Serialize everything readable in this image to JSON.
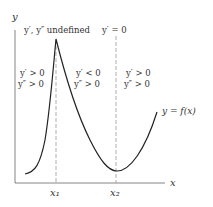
{
  "diagram": {
    "axes": {
      "y_label": "y",
      "x_label": "x",
      "x_ticks": [
        "x₁",
        "x₂"
      ]
    },
    "curve_label": "y = f(x)",
    "annotations": {
      "top_left": "y′, y″ undefined",
      "top_right": "y′ = 0",
      "region1": [
        "y′ > 0",
        "y″ > 0"
      ],
      "region2": [
        "y′ < 0",
        "y″ > 0"
      ],
      "region3": [
        "y′ > 0",
        "y″ > 0"
      ]
    },
    "colors": {
      "curve": "#222222",
      "axis": "#555555",
      "dashed": "#999999"
    }
  }
}
